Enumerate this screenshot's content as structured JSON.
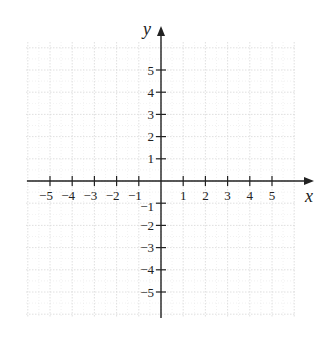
{
  "chart_data": {
    "type": "scatter",
    "title": "",
    "xlabel": "x",
    "ylabel": "y",
    "xlim": [
      -6,
      6
    ],
    "ylim": [
      -6,
      6
    ],
    "grid": true,
    "x_ticks": [
      -5,
      -4,
      -3,
      -2,
      -1,
      1,
      2,
      3,
      4,
      5
    ],
    "y_ticks": [
      -5,
      -4,
      -3,
      -2,
      -1,
      1,
      2,
      3,
      4,
      5
    ],
    "x_tick_labels": [
      "−5",
      "−4",
      "−3",
      "−2",
      "−1",
      "1",
      "2",
      "3",
      "4",
      "5"
    ],
    "y_tick_labels": [
      "−5",
      "−4",
      "−3",
      "−2",
      "−1",
      "1",
      "2",
      "3",
      "4",
      "5"
    ],
    "series": [],
    "legend": null
  },
  "colors": {
    "axis": "#222222",
    "grid": "#d8d8d8",
    "background": "#ffffff"
  }
}
